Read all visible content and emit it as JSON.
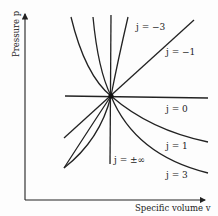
{
  "diagram": {
    "title": "",
    "x_axis_label": "Specific volume v",
    "y_axis_label": "Pressure p",
    "center_point": "common intersection point",
    "curves": [
      {
        "id": "j_neg3",
        "label": "j = −3"
      },
      {
        "id": "j_neg1",
        "label": "j = −1"
      },
      {
        "id": "j_0",
        "label": "j = 0"
      },
      {
        "id": "j_1",
        "label": "j = 1"
      },
      {
        "id": "j_inf",
        "label": "j = ±∞"
      },
      {
        "id": "j_3",
        "label": "j = 3"
      }
    ]
  },
  "colors": {
    "line": "#222222",
    "background": "#fdfdfd"
  }
}
